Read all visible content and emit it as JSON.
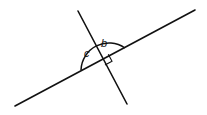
{
  "diagram": {
    "type": "angle-geometry",
    "lines": [
      {
        "name": "long-line"
      },
      {
        "name": "perpendicular-line"
      }
    ],
    "angles": [
      {
        "label": "c",
        "marked_by": "arc"
      },
      {
        "label": "b",
        "marked_by": "arc"
      },
      {
        "label": "",
        "marked_by": "right-angle-square",
        "degrees": 90
      }
    ],
    "colors": {
      "stroke": "#111111",
      "background": "#ffffff"
    }
  }
}
